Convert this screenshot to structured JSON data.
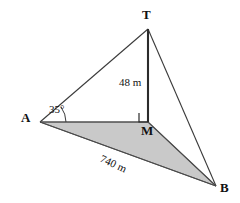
{
  "diagram": {
    "type": "geometry-elevation-triangle",
    "background_color": "#ffffff",
    "stroke_color": "#3a3a3a",
    "thick_stroke_color": "#2b2b2b",
    "shaded_fill_color": "#c9c9c9",
    "vertices": {
      "T": {
        "label": "T",
        "x": 148,
        "y": 29
      },
      "A": {
        "label": "A",
        "x": 40,
        "y": 122
      },
      "M": {
        "label": "M",
        "x": 148,
        "y": 122
      },
      "B": {
        "label": "B",
        "x": 216,
        "y": 186
      }
    },
    "segments": [
      {
        "name": "segment-AT",
        "from": "A",
        "to": "T",
        "weight": "thin"
      },
      {
        "name": "segment-TB",
        "from": "T",
        "to": "B",
        "weight": "thin"
      },
      {
        "name": "segment-TM",
        "from": "T",
        "to": "M",
        "weight": "thick"
      },
      {
        "name": "segment-AM",
        "from": "A",
        "to": "M",
        "weight": "thin"
      },
      {
        "name": "segment-MB",
        "from": "M",
        "to": "B",
        "weight": "thin"
      },
      {
        "name": "segment-AB",
        "from": "A",
        "to": "B",
        "weight": "thin"
      }
    ],
    "shaded_region": {
      "name": "triangle-AMB",
      "vertices": [
        "A",
        "M",
        "B"
      ]
    },
    "measurements": {
      "height_label": "48 m",
      "base_label": "740 m",
      "angle_label": "35°"
    },
    "markers": {
      "right_angle_at": "M",
      "angle_arc_at": "A"
    }
  }
}
